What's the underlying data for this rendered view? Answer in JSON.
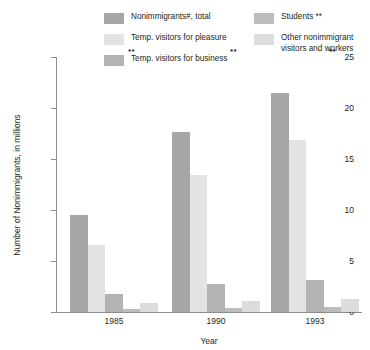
{
  "chart_data": {
    "type": "bar",
    "title": "",
    "xlabel": "Year",
    "ylabel": "Number of Nonimmigrants, in millions",
    "categories": [
      "1985",
      "1990",
      "1993"
    ],
    "ylim": [
      0,
      25
    ],
    "yticks": [
      "0",
      "5",
      "10",
      "15",
      "20",
      "25"
    ],
    "grid": false,
    "legend_position": "top",
    "series": [
      {
        "name": "Nonimmigrants#, total",
        "color": "#a6a6a6",
        "values": [
          9.5,
          17.6,
          21.5
        ],
        "notes": [
          "",
          "",
          ""
        ]
      },
      {
        "name": "Temp. visitors for pleasure",
        "color": "#e3e3e3",
        "values": [
          6.6,
          13.4,
          16.9
        ],
        "notes": [
          "",
          "",
          ""
        ]
      },
      {
        "name": "Temp. visitors for business",
        "color": "#b3b3b3",
        "values": [
          1.8,
          2.7,
          3.1
        ],
        "notes": [
          "",
          "",
          ""
        ]
      },
      {
        "name": "Students **",
        "color": "#bdbdbd",
        "values": [
          0.25,
          0.4,
          0.45
        ],
        "notes": [
          "**",
          "**",
          "**"
        ]
      },
      {
        "name": "Other nonimmigrant\nvisitors and workers",
        "color": "#dcdcdc",
        "values": [
          0.85,
          1.1,
          1.3
        ],
        "notes": [
          "",
          "",
          ""
        ]
      }
    ]
  },
  "legend": {
    "columns": [
      {
        "items": [
          {
            "label": "Nonimmigrants#, total",
            "color": "#a6a6a6",
            "swatch_name": "legend-swatch-total"
          },
          {
            "label": "Temp. visitors for pleasure",
            "color": "#e3e3e3",
            "swatch_name": "legend-swatch-pleasure"
          },
          {
            "label": "Temp. visitors for business",
            "color": "#b3b3b3",
            "swatch_name": "legend-swatch-business"
          }
        ]
      },
      {
        "items": [
          {
            "label": "Students **",
            "color": "#bdbdbd",
            "swatch_name": "legend-swatch-students"
          },
          {
            "label": "Other nonimmigrant\nvisitors and workers",
            "color": "#dcdcdc",
            "swatch_name": "legend-swatch-other"
          }
        ]
      }
    ]
  },
  "axes": {
    "y_title": "Number of Nonimmigrants, in millions",
    "x_title": "Year"
  }
}
